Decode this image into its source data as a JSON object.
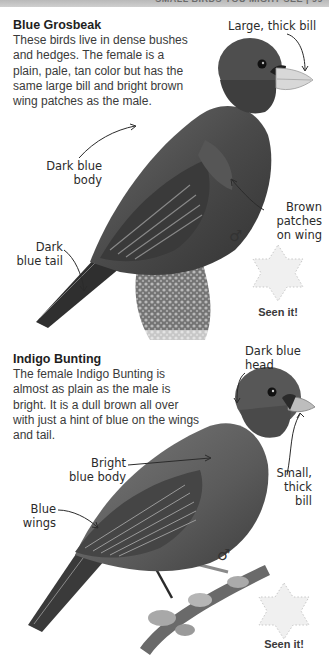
{
  "header": {
    "title": "SMALL BIRDS YOU MIGHT SEE  |  99"
  },
  "birds": [
    {
      "name": "Blue Grosbeak",
      "description": "These birds live in dense bushes and hedges. The female is a plain, pale, tan color but has the same large bill and bright brown wing patches as the male.",
      "labels": {
        "bill": "Large, thick bill",
        "body": "Dark blue\nbody",
        "tail": "Dark\nblue tail",
        "wing": "Brown\npatches\non wing"
      },
      "sex_symbol": "♂",
      "seen_it": "Seen it!"
    },
    {
      "name": "Indigo Bunting",
      "description": "The female Indigo Bunting is almost as plain as the male is bright. It is a dull brown all over with just a hint of blue on the wings and tail.",
      "labels": {
        "head": "Dark blue\nhead",
        "body": "Bright\nblue body",
        "wings": "Blue\nwings",
        "bill": "Small,\nthick\nbill"
      },
      "sex_symbol": "♂",
      "seen_it": "Seen it!"
    }
  ],
  "colors": {
    "text": "#2a2a2a",
    "header_bar": "#c4c4c4",
    "star_fill": "#f0f0f0",
    "star_dots": "#c8c8c8"
  }
}
